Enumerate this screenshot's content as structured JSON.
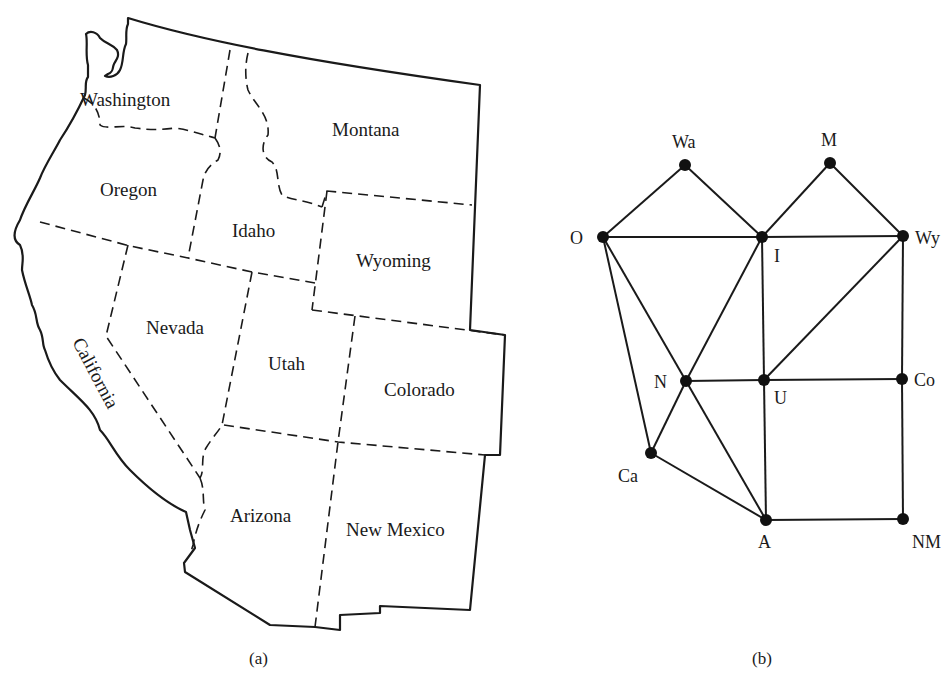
{
  "figure": {
    "panel_a": {
      "caption": "(a)",
      "title": "Map of western United States",
      "states": [
        {
          "name": "Washington",
          "x": 80,
          "y": 106
        },
        {
          "name": "Oregon",
          "x": 100,
          "y": 196
        },
        {
          "name": "Idaho",
          "x": 232,
          "y": 237
        },
        {
          "name": "Montana",
          "x": 332,
          "y": 136
        },
        {
          "name": "Wyoming",
          "x": 356,
          "y": 267
        },
        {
          "name": "Nevada",
          "x": 146,
          "y": 334
        },
        {
          "name": "Utah",
          "x": 268,
          "y": 370
        },
        {
          "name": "Colorado",
          "x": 384,
          "y": 396
        },
        {
          "name": "California",
          "x": 0,
          "y": 0
        },
        {
          "name": "Arizona",
          "x": 230,
          "y": 522
        },
        {
          "name": "New Mexico",
          "x": 346,
          "y": 536
        }
      ]
    },
    "panel_b": {
      "caption": "(b)",
      "title": "Adjacency graph of states",
      "nodes": [
        {
          "id": "Wa",
          "label": "Wa",
          "x": 685,
          "y": 165
        },
        {
          "id": "M",
          "label": "M",
          "x": 830,
          "y": 163
        },
        {
          "id": "O",
          "label": "O",
          "x": 603,
          "y": 237
        },
        {
          "id": "I",
          "label": "I",
          "x": 762,
          "y": 237
        },
        {
          "id": "Wy",
          "label": "Wy",
          "x": 903,
          "y": 236
        },
        {
          "id": "N",
          "label": "N",
          "x": 686,
          "y": 381
        },
        {
          "id": "U",
          "label": "U",
          "x": 764,
          "y": 380
        },
        {
          "id": "Co",
          "label": "Co",
          "x": 902,
          "y": 379
        },
        {
          "id": "Ca",
          "label": "Ca",
          "x": 651,
          "y": 453
        },
        {
          "id": "A",
          "label": "A",
          "x": 766,
          "y": 520
        },
        {
          "id": "NM",
          "label": "NM",
          "x": 903,
          "y": 519
        }
      ],
      "edges": [
        [
          "Wa",
          "O"
        ],
        [
          "Wa",
          "I"
        ],
        [
          "M",
          "I"
        ],
        [
          "M",
          "Wy"
        ],
        [
          "O",
          "I"
        ],
        [
          "I",
          "Wy"
        ],
        [
          "O",
          "N"
        ],
        [
          "O",
          "Ca"
        ],
        [
          "I",
          "N"
        ],
        [
          "I",
          "U"
        ],
        [
          "Wy",
          "U"
        ],
        [
          "Wy",
          "Co"
        ],
        [
          "N",
          "U"
        ],
        [
          "U",
          "Co"
        ],
        [
          "N",
          "Ca"
        ],
        [
          "N",
          "A"
        ],
        [
          "Ca",
          "A"
        ],
        [
          "U",
          "A"
        ],
        [
          "Co",
          "NM"
        ],
        [
          "A",
          "NM"
        ]
      ]
    }
  }
}
